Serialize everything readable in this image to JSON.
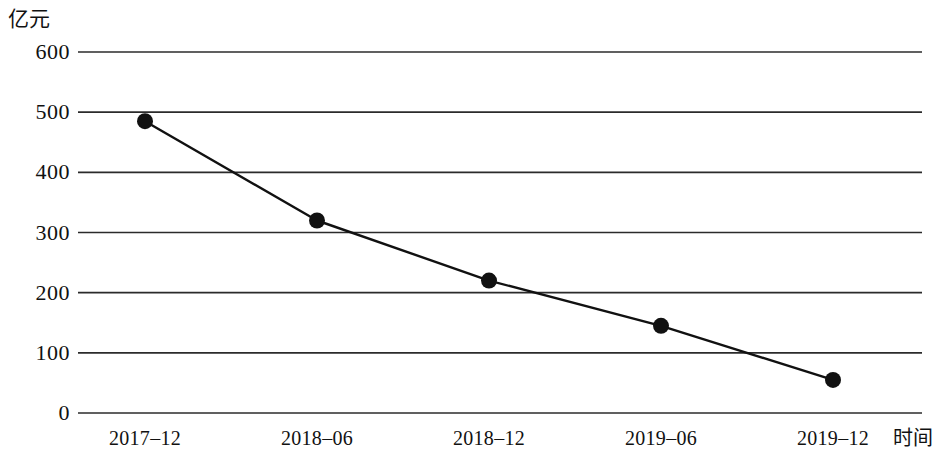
{
  "chart_data": {
    "type": "line",
    "title": "",
    "subtitle": "",
    "xlabel": "时间",
    "ylabel": "亿元",
    "categories": [
      "2017-12",
      "2018-06",
      "2018-12",
      "2019-06",
      "2019-12"
    ],
    "x_tick_labels": [
      "2017–12",
      "2018–06",
      "2018–12",
      "2019–06",
      "2019–12"
    ],
    "values": [
      485,
      320,
      220,
      145,
      55
    ],
    "series": [
      {
        "name": "",
        "values": [
          485,
          320,
          220,
          145,
          55
        ]
      }
    ],
    "ylim": [
      0,
      600
    ],
    "y_ticks": [
      0,
      100,
      200,
      300,
      400,
      500,
      600
    ],
    "y_tick_labels": [
      "0",
      "100",
      "200",
      "300",
      "400",
      "500",
      "600"
    ],
    "grid": "horizontal",
    "legend": "none",
    "marker": "filled-circle",
    "line_color": "#111111",
    "marker_color": "#111111",
    "grid_color": "#2b2b2b",
    "background_color": "#ffffff",
    "annotations": []
  },
  "axis": {
    "unit_label": "亿元",
    "time_label": "时间"
  }
}
